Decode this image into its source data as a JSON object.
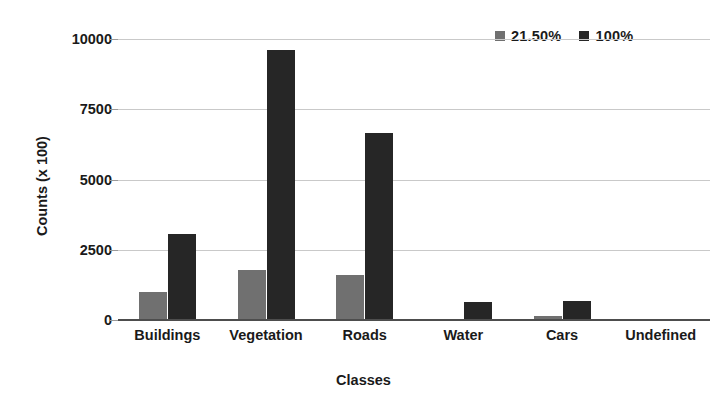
{
  "chart_data": {
    "type": "bar",
    "title": "",
    "xlabel": "Classes",
    "ylabel": "Counts (x 100)",
    "categories": [
      "Buildings",
      "Vegetation",
      "Roads",
      "Water",
      "Cars",
      "Undefined"
    ],
    "series": [
      {
        "name": "21.50%",
        "color": "#707070",
        "values": [
          1000,
          1790,
          1600,
          0,
          160,
          0
        ]
      },
      {
        "name": "100%",
        "color": "#262626",
        "values": [
          3050,
          9620,
          6650,
          640,
          680,
          0
        ]
      }
    ],
    "ylim": [
      0,
      10000
    ],
    "yticks": [
      0,
      2500,
      5000,
      7500,
      10000
    ],
    "ytick_labels": [
      "0",
      "2500",
      "5000",
      "7500",
      "10000"
    ],
    "grid": true,
    "legend_position": "top-right",
    "background": "#ffffff"
  }
}
